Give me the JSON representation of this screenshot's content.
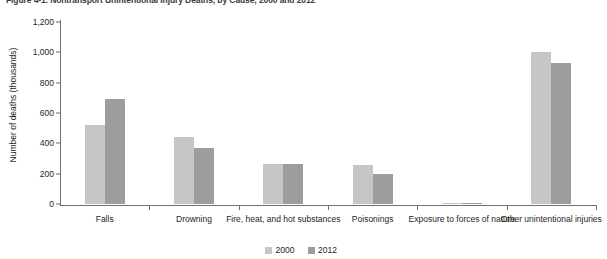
{
  "figure": {
    "title": "Figure 4-1.  Nontransport Unintentional Injury Deaths, by Cause, 2000 and 2012"
  },
  "chart_data": {
    "type": "bar",
    "title": "Figure 4-1.  Nontransport Unintentional Injury Deaths, by Cause, 2000 and 2012",
    "xlabel": "",
    "ylabel": "Number of deaths (thousands)",
    "ylim": [
      0,
      1200
    ],
    "ytick_step": 200,
    "ytick_labels": [
      "1,200",
      "1,000",
      "800",
      "600",
      "400",
      "200",
      "0"
    ],
    "ytick_values": [
      1200,
      1000,
      800,
      600,
      400,
      200,
      0
    ],
    "grid": false,
    "legend_position": "bottom-center",
    "categories": [
      "Falls",
      "Drowning",
      "Fire, heat, and hot substances",
      "Poisonings",
      "Exposure to forces of nature",
      "Other unintentional injuries"
    ],
    "series": [
      {
        "name": "2000",
        "color": "#c6c6c6",
        "values": [
          520,
          440,
          265,
          255,
          5,
          1005
        ]
      },
      {
        "name": "2012",
        "color": "#9d9d9d",
        "values": [
          690,
          370,
          265,
          195,
          5,
          930
        ]
      }
    ]
  },
  "legend": {
    "items": [
      {
        "label": "2000",
        "color": "#c6c6c6"
      },
      {
        "label": "2012",
        "color": "#9d9d9d"
      }
    ]
  }
}
